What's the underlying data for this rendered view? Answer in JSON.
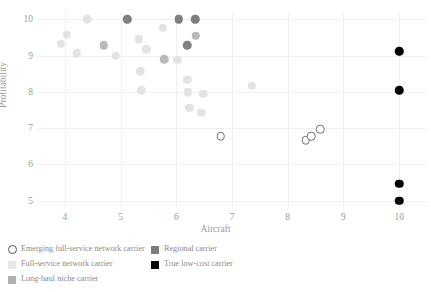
{
  "chart_data": {
    "type": "scatter",
    "title": "",
    "xlabel": "Aircraft",
    "ylabel": "Profitability",
    "xlim": [
      3.5,
      10.5
    ],
    "ylim": [
      4.8,
      10.2
    ],
    "xticks": [
      4,
      5,
      6,
      7,
      8,
      9,
      10
    ],
    "yticks": [
      5,
      6,
      7,
      8,
      9,
      10
    ],
    "grid": true,
    "legend_position": "below-left",
    "series": [
      {
        "name": "Emerging full-service network carrier",
        "marker": "open-circle",
        "color": "#ffffff",
        "edge_color": "#6e6e6e",
        "points": [
          {
            "x": 6.8,
            "y": 6.77
          },
          {
            "x": 8.32,
            "y": 6.66
          },
          {
            "x": 8.42,
            "y": 6.78
          },
          {
            "x": 8.58,
            "y": 6.97
          }
        ]
      },
      {
        "name": "Full-service network carrier",
        "marker": "filled-circle",
        "color": "#e3e3e3",
        "points": [
          {
            "x": 3.93,
            "y": 9.33
          },
          {
            "x": 4.03,
            "y": 9.57
          },
          {
            "x": 4.21,
            "y": 9.07
          },
          {
            "x": 4.4,
            "y": 10.0
          },
          {
            "x": 4.91,
            "y": 9.0
          },
          {
            "x": 5.12,
            "y": 10.0
          },
          {
            "x": 5.33,
            "y": 9.45
          },
          {
            "x": 5.35,
            "y": 8.57
          },
          {
            "x": 5.37,
            "y": 8.05
          },
          {
            "x": 5.46,
            "y": 9.17
          },
          {
            "x": 5.76,
            "y": 9.77
          },
          {
            "x": 6.02,
            "y": 8.88
          },
          {
            "x": 6.04,
            "y": 10.0
          },
          {
            "x": 6.2,
            "y": 8.33
          },
          {
            "x": 6.21,
            "y": 7.99
          },
          {
            "x": 6.23,
            "y": 7.56
          },
          {
            "x": 6.34,
            "y": 10.0
          },
          {
            "x": 6.48,
            "y": 7.95
          },
          {
            "x": 6.45,
            "y": 7.42
          },
          {
            "x": 7.35,
            "y": 8.17
          }
        ]
      },
      {
        "name": "Long-haul niche carrier",
        "marker": "filled-circle",
        "color": "#b9b9b9",
        "points": [
          {
            "x": 4.7,
            "y": 9.28
          },
          {
            "x": 5.78,
            "y": 8.9
          },
          {
            "x": 6.35,
            "y": 9.55
          }
        ]
      },
      {
        "name": "Regional carrier",
        "marker": "filled-circle",
        "color": "#808080",
        "points": [
          {
            "x": 5.12,
            "y": 10.0
          },
          {
            "x": 6.04,
            "y": 10.0
          },
          {
            "x": 6.34,
            "y": 10.0
          },
          {
            "x": 6.2,
            "y": 9.28
          }
        ]
      },
      {
        "name": "True low-cost carrier",
        "marker": "filled-circle",
        "color": "#000000",
        "points": [
          {
            "x": 10.0,
            "y": 9.12
          },
          {
            "x": 10.0,
            "y": 8.05
          },
          {
            "x": 10.0,
            "y": 5.47
          },
          {
            "x": 10.0,
            "y": 5.0
          }
        ]
      }
    ]
  },
  "legend": {
    "left_column": [
      {
        "label": "Emerging full-service network carrier",
        "swatch": "circle-open",
        "color": "#ffffff"
      },
      {
        "label": "Full-service network carrier",
        "swatch": "square",
        "color": "#e8e8e8"
      },
      {
        "label": "Long-haul niche carrier",
        "swatch": "square",
        "color": "#b0b0b0"
      }
    ],
    "right_column": [
      {
        "label": "Regional carrier",
        "swatch": "square",
        "color": "#7d7d7d"
      },
      {
        "label": "True low-cost carrier",
        "swatch": "square",
        "color": "#000000"
      }
    ]
  },
  "axes": {
    "x_label": "Aircraft",
    "y_label": "Profitability",
    "x_tick_labels": [
      "4",
      "5",
      "6",
      "7",
      "8",
      "9",
      "10"
    ],
    "y_tick_labels": [
      "5",
      "6",
      "7",
      "8",
      "9",
      "10"
    ]
  }
}
